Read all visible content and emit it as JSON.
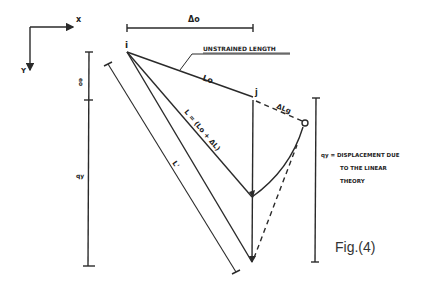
{
  "figure": {
    "caption": "Fig.(4)",
    "axes": {
      "x_label": "x",
      "y_label": "Y"
    },
    "labels": {
      "delta_o": "Δo",
      "point_i": "i",
      "point_j": "j",
      "unstrained_length": "UNSTRAINED LENGTH",
      "lo": "Lo",
      "l_eq": "L = (Lo + ΔL)",
      "delta_lg": "ΔLg",
      "l_prime": "L'",
      "eo": "eo",
      "qy_left": "qy",
      "qy_desc_line1": "qy = DISPLACEMENT DUE",
      "qy_desc_line2": "TO THE LINEAR",
      "qy_desc_line3": "THEORY"
    },
    "stroke_color": "#2a2a2a"
  }
}
